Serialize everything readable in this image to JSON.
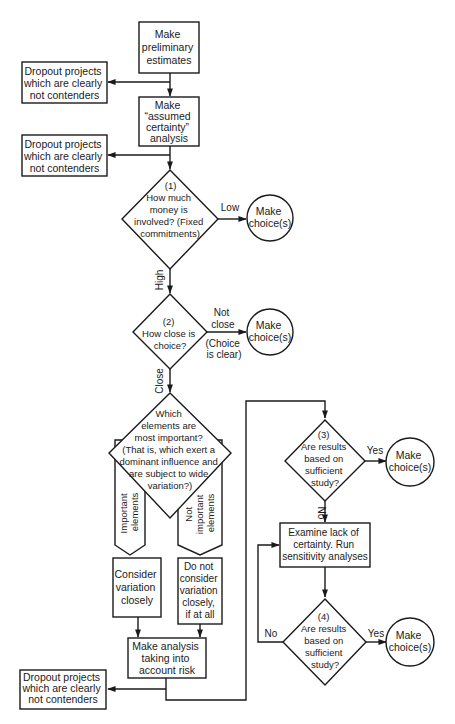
{
  "diagram": {
    "type": "flowchart",
    "colors": {
      "line": "#1a1a1a",
      "background": "#ffffff"
    },
    "nodes": {
      "prelim": {
        "shape": "box",
        "lines": [
          "Make",
          "preliminary",
          "estimates"
        ]
      },
      "assumed": {
        "shape": "box",
        "lines": [
          "Make",
          "“assumed",
          "certainty”",
          "analysis"
        ]
      },
      "dropout1": {
        "shape": "box",
        "lines": [
          "Dropout projects",
          "which are clearly",
          "not contenders"
        ]
      },
      "dropout2": {
        "shape": "box",
        "lines": [
          "Dropout projects",
          "which are clearly",
          "not contenders"
        ]
      },
      "dropout3": {
        "shape": "box",
        "lines": [
          "Dropout projects",
          "which are clearly",
          "not contenders"
        ]
      },
      "q1": {
        "shape": "diamond",
        "lines": [
          "(1)",
          "How much",
          "money is",
          "involved? (Fixed",
          "commitments)"
        ]
      },
      "q2": {
        "shape": "diamond",
        "lines": [
          "(2)",
          "How close is",
          "choice?"
        ]
      },
      "q_elements": {
        "shape": "diamond",
        "lines": [
          "Which",
          "elements are",
          "most  important?",
          "(That is, which exert a",
          "dominant influence and",
          "are subject to wide",
          "variation?)"
        ]
      },
      "important": {
        "shape": "pentagon-arrow",
        "lines": [
          "Important",
          "elements"
        ]
      },
      "not_important": {
        "shape": "pentagon-arrow",
        "lines": [
          "Not",
          "important",
          "elements"
        ]
      },
      "consider": {
        "shape": "box",
        "lines": [
          "Consider",
          "variation",
          "closely"
        ]
      },
      "not_consider": {
        "shape": "box",
        "lines": [
          "Do not",
          "consider",
          "variation",
          "closely,",
          "if at all"
        ]
      },
      "risk": {
        "shape": "box",
        "lines": [
          "Make analysis",
          "taking into",
          "account risk"
        ]
      },
      "q3": {
        "shape": "diamond",
        "lines": [
          "(3)",
          "Are results",
          "based on",
          "sufficient",
          "study?"
        ]
      },
      "examine": {
        "shape": "box",
        "lines": [
          "Examine lack of",
          "certainty. Run",
          "sensitivity analyses"
        ]
      },
      "q4": {
        "shape": "diamond",
        "lines": [
          "(4)",
          "Are results",
          "based on",
          "sufficient",
          "study?"
        ]
      },
      "choice1": {
        "shape": "circle",
        "lines": [
          "Make",
          "choice(s)"
        ]
      },
      "choice2": {
        "shape": "circle",
        "lines": [
          "Make",
          "choice(s)"
        ]
      },
      "choice3": {
        "shape": "circle",
        "lines": [
          "Make",
          "choice(s)"
        ]
      },
      "choice4": {
        "shape": "circle",
        "lines": [
          "Make",
          "choice(s)"
        ]
      }
    },
    "edge_labels": {
      "q1_low": "Low",
      "q1_high": "High",
      "q2_not_close_1": "Not",
      "q2_not_close_2": "close",
      "q2_clear_1": "(Choice",
      "q2_clear_2": "is clear)",
      "q2_close": "Close",
      "q3_yes": "Yes",
      "q3_no": "No",
      "q4_yes": "Yes",
      "q4_no": "No"
    },
    "edges": [
      [
        "prelim",
        "assumed"
      ],
      [
        "prelim",
        "dropout1"
      ],
      [
        "assumed",
        "dropout2"
      ],
      [
        "assumed",
        "q1"
      ],
      [
        "q1",
        "choice1",
        "Low"
      ],
      [
        "q1",
        "q2",
        "High"
      ],
      [
        "q2",
        "choice2",
        "Not close (Choice is clear)"
      ],
      [
        "q2",
        "q_elements",
        "Close"
      ],
      [
        "q_elements",
        "important"
      ],
      [
        "q_elements",
        "not_important"
      ],
      [
        "important",
        "consider"
      ],
      [
        "not_important",
        "not_consider"
      ],
      [
        "consider",
        "risk"
      ],
      [
        "not_consider",
        "risk"
      ],
      [
        "risk",
        "dropout3"
      ],
      [
        "risk",
        "q3"
      ],
      [
        "q3",
        "choice3",
        "Yes"
      ],
      [
        "q3",
        "examine",
        "No"
      ],
      [
        "examine",
        "q4"
      ],
      [
        "q4",
        "choice4",
        "Yes"
      ],
      [
        "q4",
        "examine",
        "No"
      ]
    ]
  }
}
